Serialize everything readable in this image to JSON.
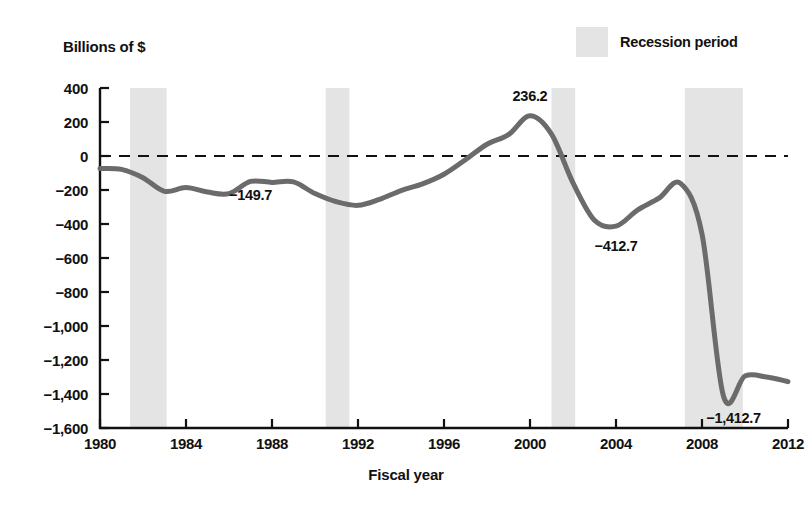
{
  "chart_data": {
    "type": "line",
    "title": "",
    "ylabel": "Billions of $",
    "xlabel": "Fiscal year",
    "ylim": [
      -1600,
      400
    ],
    "xlim": [
      1980,
      2012
    ],
    "y_ticks": [
      400,
      200,
      0,
      -200,
      -400,
      -600,
      -800,
      -1000,
      -1200,
      -1400,
      -1600
    ],
    "y_tick_labels": [
      "400",
      "200",
      "0",
      "−200",
      "−400",
      "−600",
      "−800",
      "−1,000",
      "−1,200",
      "−1,400",
      "−1,600"
    ],
    "x_ticks": [
      1980,
      1984,
      1988,
      1992,
      1996,
      2000,
      2004,
      2008,
      2012
    ],
    "x_tick_labels": [
      "1980",
      "1984",
      "1988",
      "1992",
      "1996",
      "2000",
      "2004",
      "2008",
      "2012"
    ],
    "grid": false,
    "zero_line": true,
    "zero_line_style": "dashed",
    "series": [
      {
        "name": "Federal budget surplus or deficit",
        "color": "#6b6b6b",
        "x": [
          1980,
          1981,
          1982,
          1983,
          1984,
          1985,
          1986,
          1987,
          1988,
          1989,
          1990,
          1991,
          1992,
          1993,
          1994,
          1995,
          1996,
          1997,
          1998,
          1999,
          2000,
          2001,
          2002,
          2003,
          2004,
          2005,
          2006,
          2007,
          2008,
          2009,
          2010,
          2011,
          2012
        ],
        "values": [
          -73.8,
          -79.0,
          -128.0,
          -207.8,
          -185.4,
          -212.3,
          -221.2,
          -149.7,
          -155.2,
          -152.6,
          -221.0,
          -269.2,
          -290.3,
          -255.1,
          -203.2,
          -164.0,
          -107.4,
          -21.9,
          69.3,
          125.6,
          236.2,
          128.2,
          -157.8,
          -377.6,
          -412.7,
          -318.3,
          -248.2,
          -160.7,
          -458.6,
          -1412.7,
          -1294.4,
          -1300.0,
          -1327.0
        ]
      }
    ],
    "annotations": [
      {
        "label": "−149.7",
        "x": 1987,
        "y": -149.7,
        "position": "above"
      },
      {
        "label": "236.2",
        "x": 2000,
        "y": 236.2,
        "position": "above"
      },
      {
        "label": "−412.7",
        "x": 2004,
        "y": -412.7,
        "position": "below"
      },
      {
        "label": "−1,412.7",
        "x": 2009,
        "y": -1412.7,
        "position": "below"
      }
    ],
    "shaded_regions": {
      "legend_label": "Recession period",
      "color": "#e4e4e4",
      "bands": [
        {
          "start": 1981.4,
          "end": 1983.1
        },
        {
          "start": 1990.5,
          "end": 1991.6
        },
        {
          "start": 2001.0,
          "end": 2002.1
        },
        {
          "start": 2007.2,
          "end": 2009.9
        }
      ]
    }
  },
  "legend": {
    "label": "Recession period"
  },
  "axes": {
    "y_title": "Billions of $",
    "x_title": "Fiscal year"
  }
}
